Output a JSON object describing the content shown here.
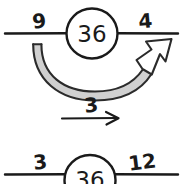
{
  "diagram": {
    "type": "hand-drawn-math-number-bond",
    "background_color": "#ffffff",
    "ink_color": "#1a1a1a",
    "shade_color": "#c9c9c9",
    "top_row": {
      "left_label": "9",
      "circle_value": "36",
      "right_label": "4",
      "curved_arrow": {
        "direction": "left-to-right-under-circle",
        "arrowhead": "hollow-chevron-up-right",
        "fill": "#d0d0d0"
      }
    },
    "middle_row": {
      "label": "3",
      "arrow": "straight-right-arrow"
    },
    "bottom_row": {
      "left_label": "3",
      "circle_value": "36",
      "right_label": "12"
    }
  }
}
